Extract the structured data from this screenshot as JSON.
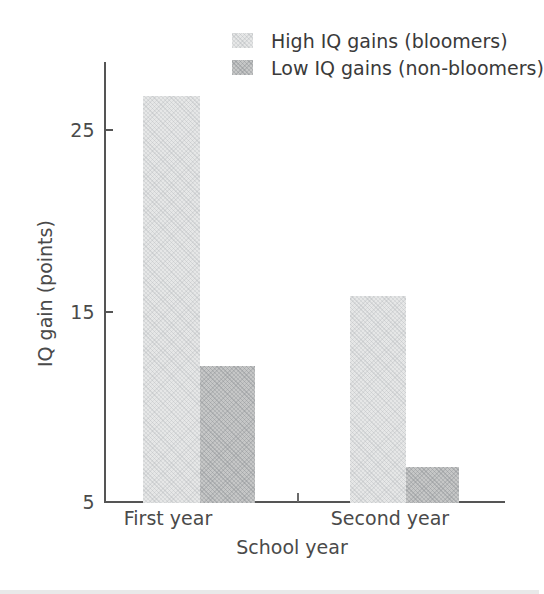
{
  "chart_data": {
    "type": "bar",
    "title": "",
    "xlabel": "School year",
    "ylabel": "IQ gain (points)",
    "categories": [
      "First year",
      "Second year"
    ],
    "series": [
      {
        "name": "High IQ gains (bloomers)",
        "values": [
          27.6,
          16.5
        ],
        "color": "#e6e7e7"
      },
      {
        "name": "Low IQ gains (non-bloomers)",
        "values": [
          12.6,
          7.0
        ],
        "color": "#c6c7c7"
      }
    ],
    "ylim": [
      5,
      29.5
    ],
    "yticks": [
      5,
      15,
      25
    ],
    "ytick_labels": [
      "5",
      "15",
      "25"
    ],
    "grid": false,
    "legend_position": "top-center"
  },
  "axis": {
    "y_label": "IQ gain (points)",
    "x_label": "School year",
    "y_ticks": [
      {
        "label": "25",
        "value": 25
      },
      {
        "label": "15",
        "value": 15
      },
      {
        "label": "5",
        "value": 5
      }
    ],
    "x_categories": [
      {
        "label": "First year"
      },
      {
        "label": "Second year"
      }
    ]
  },
  "legend": {
    "entries": [
      {
        "label": "High IQ gains (bloomers)",
        "swatch": "light-swatch-icon"
      },
      {
        "label": "Low IQ gains (non-bloomers)",
        "swatch": "dark-swatch-icon"
      }
    ]
  },
  "bars": [
    {
      "series": "High IQ gains (bloomers)",
      "category": "First year",
      "value": 27.6
    },
    {
      "series": "Low IQ gains (non-bloomers)",
      "category": "First year",
      "value": 12.6
    },
    {
      "series": "High IQ gains (bloomers)",
      "category": "Second year",
      "value": 16.5
    },
    {
      "series": "Low IQ gains (non-bloomers)",
      "category": "Second year",
      "value": 7.0
    }
  ]
}
